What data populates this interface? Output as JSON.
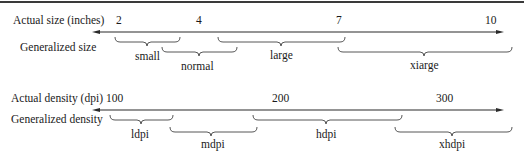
{
  "size_row": {
    "actual_label": "Actual size (inches)",
    "generalized_label": "Generalized size",
    "ticks": [
      {
        "value": "2",
        "x": 120
      },
      {
        "value": "4",
        "x": 198
      },
      {
        "value": "7",
        "x": 338
      },
      {
        "value": "10",
        "x": 486
      }
    ],
    "categories": [
      {
        "label": "small",
        "x1": 115,
        "x2": 180,
        "level": 0
      },
      {
        "label": "normal",
        "x1": 162,
        "x2": 237,
        "level": 1
      },
      {
        "label": "large",
        "x1": 218,
        "x2": 345,
        "level": 0
      },
      {
        "label": "xiarge",
        "x1": 338,
        "x2": 512,
        "level": 1
      }
    ]
  },
  "density_row": {
    "actual_label": "Actual density (dpi)",
    "generalized_label": "Generalized density",
    "ticks": [
      {
        "value": "100",
        "x": 113
      },
      {
        "value": "200",
        "x": 283
      },
      {
        "value": "300",
        "x": 436
      }
    ],
    "categories": [
      {
        "label": "ldpi",
        "x1": 110,
        "x2": 173,
        "level": 0
      },
      {
        "label": "mdpi",
        "x1": 170,
        "x2": 257,
        "level": 1
      },
      {
        "label": "hdpi",
        "x1": 253,
        "x2": 402,
        "level": 0
      },
      {
        "label": "xhdpi",
        "x1": 395,
        "x2": 512,
        "level": 1
      }
    ]
  },
  "colors": {
    "line": "#2a2a2a",
    "brace": "#444444",
    "text": "#1a1a1a"
  }
}
